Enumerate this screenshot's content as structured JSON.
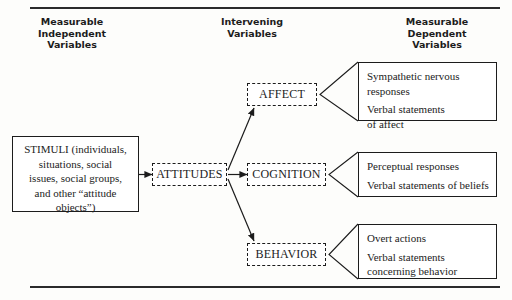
{
  "headings": {
    "left": "Measurable\nIndependent\nVariables",
    "middle": "Intervening\nVariables",
    "right": "Measurable\nDependent\nVariables"
  },
  "stimuli": {
    "text": "STIMULI (individuals,\nsituations, social\nissues, social groups,\nand other “attitude\nobjects”)"
  },
  "nodes": {
    "attitudes": "ATTITUDES",
    "affect": "AFFECT",
    "cognition": "COGNITION",
    "behavior": "BEHAVIOR"
  },
  "outcomes": {
    "affect": {
      "line1": "Sympathetic nervous",
      "line2": "responses",
      "line3": "Verbal statements",
      "line4": "of affect"
    },
    "cognition": {
      "line1": "Perceptual responses",
      "line2": "Verbal statements of beliefs"
    },
    "behavior": {
      "line1": "Overt actions",
      "line2": "Verbal statements",
      "line3": "concerning behavior"
    }
  },
  "colors": {
    "ink": "#1c1c1c",
    "paper": "#fdfdfb"
  }
}
